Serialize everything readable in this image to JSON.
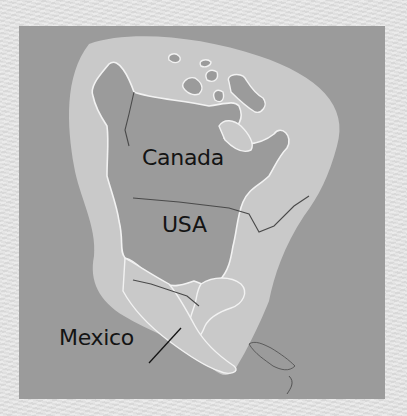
{
  "map": {
    "title": "North America",
    "labels": {
      "canada": "Canada",
      "usa": "USA",
      "mexico": "Mexico"
    },
    "colors": {
      "page_background": "#e4e4e4",
      "ocean": "#9b9b9b",
      "land_highlight_halo": "#c9c9c9",
      "land": "#9b9b9b",
      "coastline": "#f2f2f2",
      "border_line": "#4a4a4a",
      "label_text": "#141414"
    }
  }
}
